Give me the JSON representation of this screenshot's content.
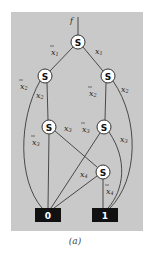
{
  "diagram": {
    "type": "decision-diagram",
    "root_label": "f",
    "node_symbol": "S",
    "nodes": [
      {
        "id": "n1",
        "label": "S",
        "var": "x1"
      },
      {
        "id": "n2L",
        "label": "S",
        "var": "x2"
      },
      {
        "id": "n2R",
        "label": "S",
        "var": "x2"
      },
      {
        "id": "n3L",
        "label": "S",
        "var": "x3"
      },
      {
        "id": "n3R",
        "label": "S",
        "var": "x3"
      },
      {
        "id": "n4",
        "label": "S",
        "var": "x4"
      }
    ],
    "terminals": [
      {
        "id": "t0",
        "label": "0"
      },
      {
        "id": "t1",
        "label": "1"
      }
    ],
    "edges": [
      {
        "from": "n1",
        "to": "n2L",
        "label": "x1",
        "negated": true
      },
      {
        "from": "n1",
        "to": "n2R",
        "label": "x1",
        "negated": false
      },
      {
        "from": "n2L",
        "to": "t0",
        "label": "x2",
        "negated": true
      },
      {
        "from": "n2L",
        "to": "n3L",
        "label": "x2",
        "negated": false
      },
      {
        "from": "n2R",
        "to": "n3R",
        "label": "x2",
        "negated": true
      },
      {
        "from": "n2R",
        "to": "t1",
        "label": "x2",
        "negated": false
      },
      {
        "from": "n3L",
        "to": "t0",
        "label": "x3",
        "negated": true
      },
      {
        "from": "n3L",
        "to": "n4",
        "label": "x3",
        "negated": false
      },
      {
        "from": "n3R",
        "to": "t0",
        "label": "x3",
        "negated": true
      },
      {
        "from": "n3R",
        "to": "t1",
        "label": "x3",
        "negated": false
      },
      {
        "from": "n4",
        "to": "t0",
        "label": "x4",
        "negated": false
      },
      {
        "from": "n4",
        "to": "t1",
        "label": "x4",
        "negated": true
      }
    ],
    "labels": {
      "x1": "x",
      "sub1": "1",
      "sub2": "2",
      "sub3": "3",
      "sub4": "4"
    }
  },
  "caption": "(a)",
  "colors": {
    "panel": "#c9c9c9",
    "line": "#3a3a3a",
    "node_fill": "#ffffff",
    "terminal_fill": "#111111"
  }
}
